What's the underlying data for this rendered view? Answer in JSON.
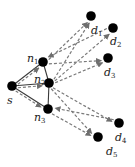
{
  "diagram": {
    "nodes": [
      {
        "id": "s",
        "label": "s",
        "sub": "",
        "x": 12,
        "y": 86,
        "lx": 7,
        "ly": 104
      },
      {
        "id": "n1",
        "label": "n",
        "sub": "1",
        "x": 43,
        "y": 62,
        "lx": 27,
        "ly": 62
      },
      {
        "id": "n2",
        "label": "n",
        "sub": "2",
        "x": 49,
        "y": 83,
        "lx": 34,
        "ly": 83
      },
      {
        "id": "n3",
        "label": "n",
        "sub": "3",
        "x": 48,
        "y": 109,
        "lx": 34,
        "ly": 121
      },
      {
        "id": "d1",
        "label": "d",
        "sub": "1",
        "x": 91,
        "y": 16,
        "lx": 91,
        "ly": 34
      },
      {
        "id": "d2",
        "label": "d",
        "sub": "2",
        "x": 113,
        "y": 28,
        "lx": 110,
        "ly": 45
      },
      {
        "id": "d3",
        "label": "d",
        "sub": "3",
        "x": 108,
        "y": 58,
        "lx": 104,
        "ly": 76
      },
      {
        "id": "d4",
        "label": "d",
        "sub": "4",
        "x": 119,
        "y": 123,
        "lx": 115,
        "ly": 141
      },
      {
        "id": "d5",
        "label": "d",
        "sub": "5",
        "x": 98,
        "y": 137,
        "lx": 106,
        "ly": 155
      }
    ],
    "solid_edges": [
      [
        "s",
        "n1"
      ],
      [
        "s",
        "n2"
      ],
      [
        "s",
        "n3"
      ],
      [
        "n1",
        "n2"
      ],
      [
        "n2",
        "n3"
      ]
    ],
    "dashed_arrows": [
      [
        "s",
        "n1"
      ],
      [
        "s",
        "n2"
      ],
      [
        "s",
        "n3"
      ],
      [
        "n1",
        "d1"
      ],
      [
        "n1",
        "d3"
      ],
      [
        "d2",
        "n1"
      ],
      [
        "n2",
        "d1"
      ],
      [
        "n2",
        "d2"
      ],
      [
        "n2",
        "d3"
      ],
      [
        "n2",
        "d4"
      ],
      [
        "n2",
        "d5"
      ],
      [
        "d4",
        "n3"
      ],
      [
        "n3",
        "d5"
      ]
    ],
    "colors": {
      "node": "#000000",
      "solid_edge": "#3a3a3a",
      "dashed_arrow": "#7a7a7a"
    }
  }
}
